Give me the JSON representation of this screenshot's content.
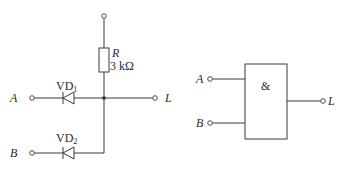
{
  "diagram": {
    "type": "circuit-schematic",
    "left_circuit": {
      "title": "Diode AND gate",
      "resistor": {
        "name": "R",
        "value": "3 kΩ"
      },
      "diodes": [
        {
          "name": "VD",
          "subscript": "1",
          "input": "A"
        },
        {
          "name": "VD",
          "subscript": "2",
          "input": "B"
        }
      ],
      "inputs": [
        "A",
        "B"
      ],
      "output": "L"
    },
    "right_circuit": {
      "title": "AND gate logic symbol",
      "symbol": "&",
      "inputs": [
        "A",
        "B"
      ],
      "output": "L"
    },
    "colors": {
      "line": "#3a3a3a",
      "text": "#2a2a2a",
      "background": "#ffffff"
    }
  }
}
